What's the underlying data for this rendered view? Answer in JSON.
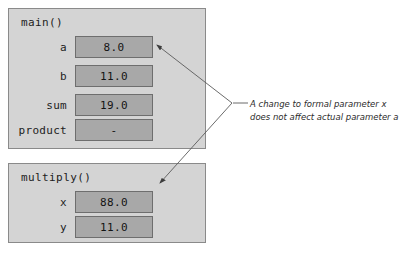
{
  "diagram": {
    "type": "memory-frame-diagram",
    "frames": [
      {
        "id": "main",
        "title": "main()",
        "variables": [
          {
            "name": "a",
            "value": "8.0"
          },
          {
            "name": "b",
            "value": "11.0"
          },
          {
            "name": "sum",
            "value": "19.0"
          },
          {
            "name": "product",
            "value": "-"
          }
        ]
      },
      {
        "id": "multiply",
        "title": "multiply()",
        "variables": [
          {
            "name": "x",
            "value": "88.0"
          },
          {
            "name": "y",
            "value": "11.0"
          }
        ]
      }
    ],
    "annotation": {
      "line1": "A change to formal parameter x",
      "line2": "does not affect actual parameter a"
    },
    "colors": {
      "frame_fill": "#d4d4d4",
      "frame_border": "#8a8a8a",
      "cell_fill": "#a8a8a8",
      "cell_border": "#6e6e6e",
      "text": "#1c1c1c",
      "leader_line": "#5a5a5a",
      "background": "#ffffff"
    }
  }
}
